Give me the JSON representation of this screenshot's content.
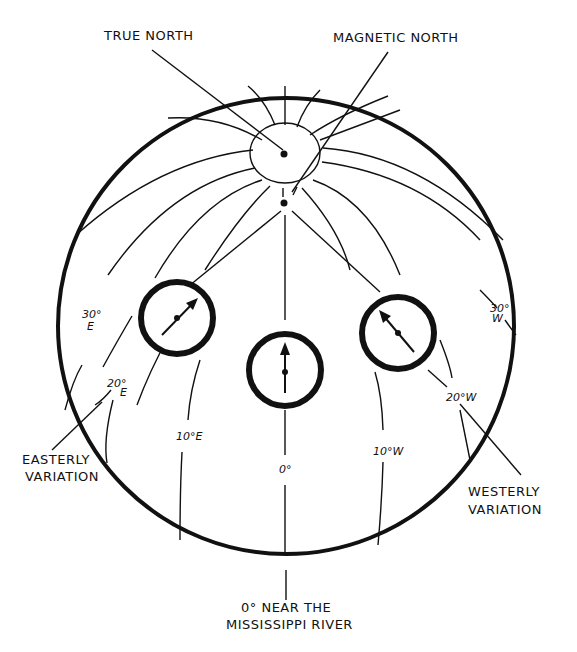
{
  "diagram": {
    "labels": {
      "true_north": "TRUE NORTH",
      "magnetic_north": "MAGNETIC NORTH",
      "easterly_variation_1": "EASTERLY",
      "easterly_variation_2": "VARIATION",
      "westerly_variation_1": "WESTERLY",
      "westerly_variation_2": "VARIATION",
      "zero_line_1": "0° NEAR THE",
      "zero_line_2": "MISSISSIPPI RIVER"
    },
    "isogonic_lines": {
      "e30_deg": "30°",
      "e30_dir": "E",
      "e20_deg": "20°",
      "e20_dir": "E",
      "e10": "10°E",
      "zero": "0°",
      "w10": "10°W",
      "w20": "20°W",
      "w30_deg": "30°",
      "w30_dir": "W"
    },
    "compasses": [
      {
        "name": "east-compass",
        "needle_direction": "northeast"
      },
      {
        "name": "center-compass",
        "needle_direction": "north"
      },
      {
        "name": "west-compass",
        "needle_direction": "northwest"
      }
    ],
    "colors": {
      "ink": "#111111",
      "paper": "#ffffff"
    }
  }
}
